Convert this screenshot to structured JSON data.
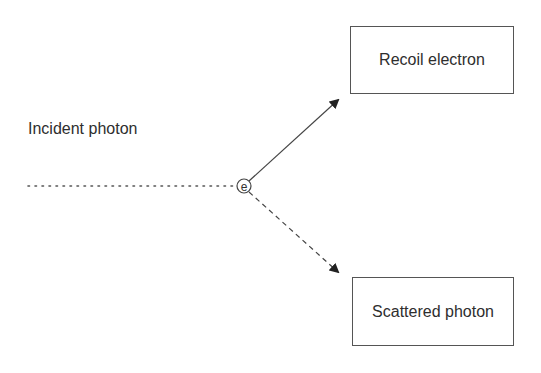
{
  "diagram": {
    "incident_label": "Incident photon",
    "electron_symbol": "e",
    "recoil_box_label": "Recoil electron",
    "scattered_box_label": "Scattered photon",
    "colors": {
      "line": "#444444",
      "text": "#2e2e2e",
      "background": "#ffffff"
    },
    "edges": [
      {
        "from": "incident",
        "to": "electron",
        "style": "dotted"
      },
      {
        "from": "electron",
        "to": "recoil-electron",
        "style": "solid-arrow"
      },
      {
        "from": "electron",
        "to": "scattered-photon",
        "style": "dashed-arrow"
      }
    ]
  }
}
